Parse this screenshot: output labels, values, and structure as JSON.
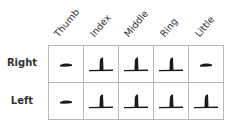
{
  "columns": [
    {
      "label": "Thumb"
    },
    {
      "label": "Index"
    },
    {
      "label": "Middle"
    },
    {
      "label": "Ring"
    },
    {
      "label": "Little"
    }
  ],
  "rows": [
    {
      "label": "Right",
      "cells": [
        "dash-icon",
        "t-shape-icon",
        "t-shape-icon",
        "t-shape-icon",
        "dash-icon"
      ]
    },
    {
      "label": "Left",
      "cells": [
        "dash-icon",
        "t-shape-icon",
        "t-shape-icon",
        "t-shape-icon",
        "t-shape-icon"
      ]
    }
  ],
  "colors": {
    "grid_border": "#b8b8b8",
    "icon_fill": "#1a1a1a",
    "text": "#333333"
  }
}
